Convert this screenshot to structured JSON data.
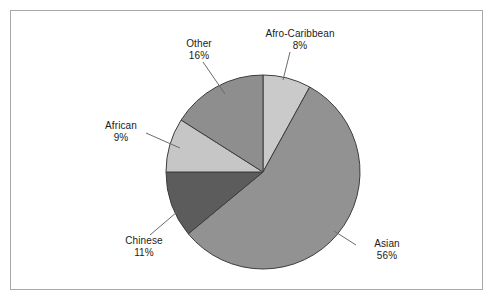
{
  "chart_data": {
    "type": "pie",
    "title": "",
    "subtitle": "",
    "xlabel": "",
    "ylabel": "",
    "legend_position": "none",
    "grid": false,
    "labels_inline": true,
    "start_angle_deg": 0,
    "direction": "clockwise",
    "categories": [
      "Afro-Caribbean",
      "Asian",
      "Chinese",
      "African",
      "Other"
    ],
    "values": [
      8,
      56,
      11,
      9,
      16
    ],
    "value_unit": "%",
    "slices": [
      {
        "label": "Afro-Caribbean",
        "value": 8,
        "value_text": "8%",
        "color": "#cacaca",
        "start_deg": 0.0,
        "end_deg": 28.8
      },
      {
        "label": "Asian",
        "value": 56,
        "value_text": "56%",
        "color": "#929292",
        "start_deg": 28.8,
        "end_deg": 230.4
      },
      {
        "label": "Chinese",
        "value": 11,
        "value_text": "11%",
        "color": "#5c5c5c",
        "start_deg": 230.4,
        "end_deg": 270.0
      },
      {
        "label": "African",
        "value": 9,
        "value_text": "9%",
        "color": "#c6c6c6",
        "start_deg": 270.0,
        "end_deg": 302.4
      },
      {
        "label": "Other",
        "value": 16,
        "value_text": "16%",
        "color": "#8e8e8e",
        "start_deg": 302.4,
        "end_deg": 360.0
      }
    ]
  },
  "style": {
    "frame_border_color": "#a8a8a8",
    "slice_outline_color": "#3d3d3d",
    "leader_line_color": "#6b6b6b",
    "text_color": "#1b1b1b",
    "background": "#ffffff"
  }
}
